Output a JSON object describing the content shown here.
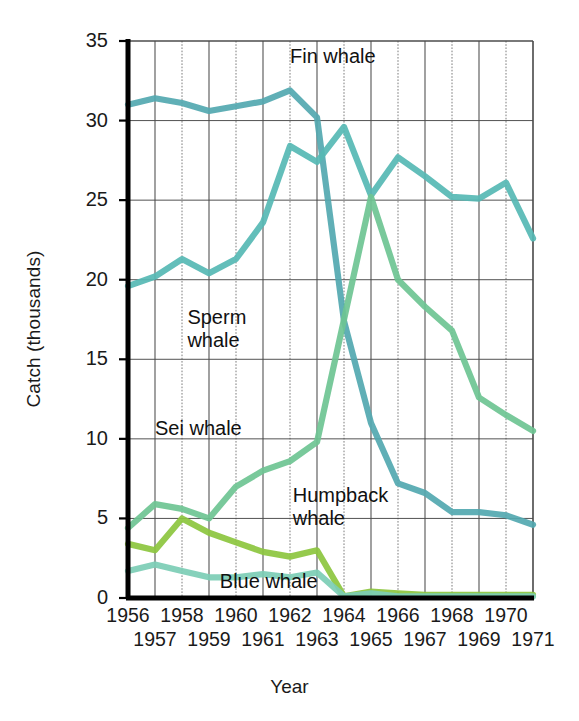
{
  "chart_data": {
    "type": "line",
    "title": "",
    "xlabel": "Year",
    "ylabel": "Catch (thousands)",
    "x": [
      1956,
      1957,
      1958,
      1959,
      1960,
      1961,
      1962,
      1963,
      1964,
      1965,
      1966,
      1967,
      1968,
      1969,
      1970,
      1971
    ],
    "xtick_labels_row1": [
      "1956",
      "1958",
      "1960",
      "1962",
      "1964",
      "1966",
      "1968",
      "1970"
    ],
    "xtick_labels_row2": [
      "1957",
      "1959",
      "1961",
      "1963",
      "1965",
      "1967",
      "1969",
      "1971"
    ],
    "ytick_labels": [
      "35",
      "30",
      "25",
      "20",
      "15",
      "10",
      "5",
      "0"
    ],
    "ytick_values": [
      35,
      30,
      25,
      20,
      15,
      10,
      5,
      0
    ],
    "ylim": [
      0,
      35
    ],
    "xlim": [
      1956,
      1971
    ],
    "grid": true,
    "legend_position": "inline-annotations",
    "series": [
      {
        "name": "Fin whale",
        "color": "#52a8b0",
        "label_text": "Fin whale",
        "values": [
          31.0,
          31.4,
          31.1,
          30.6,
          30.9,
          31.2,
          31.9,
          30.2,
          17.4,
          11.0,
          7.2,
          6.6,
          5.4,
          5.4,
          5.2,
          4.6
        ]
      },
      {
        "name": "Sperm whale",
        "color": "#56b8b4",
        "label_text": "Sperm whale",
        "values": [
          19.6,
          20.2,
          21.3,
          20.4,
          21.3,
          23.6,
          28.4,
          27.4,
          29.6,
          25.3,
          27.7,
          26.5,
          25.2,
          25.1,
          26.1,
          22.6
        ]
      },
      {
        "name": "Sei whale",
        "color": "#6ec493",
        "label_text": "Sei whale",
        "values": [
          4.4,
          5.9,
          5.6,
          5.0,
          7.0,
          8.0,
          8.6,
          9.8,
          17.5,
          25.2,
          20.0,
          18.3,
          16.8,
          12.6,
          11.5,
          10.5
        ]
      },
      {
        "name": "Humpback whale",
        "color": "#8cc63e",
        "label_text": "Humpback whale",
        "values": [
          3.4,
          3.0,
          5.0,
          4.1,
          3.5,
          2.9,
          2.6,
          3.0,
          0.1,
          0.4,
          0.3,
          0.2,
          0.2,
          0.2,
          0.2,
          0.2
        ]
      },
      {
        "name": "Blue whale",
        "color": "#7ccdb5",
        "label_text": "Blue whale",
        "values": [
          1.7,
          2.1,
          1.7,
          1.3,
          1.3,
          1.5,
          1.3,
          1.6,
          0.1,
          0.3,
          0.1,
          0.1,
          0.1,
          0.1,
          0.1,
          0.1
        ]
      }
    ],
    "annotations": [
      {
        "text": "Fin whale",
        "x": 1962,
        "y": 34.0
      },
      {
        "text": "Sperm whale",
        "x": 1958.2,
        "y": 17.6
      },
      {
        "text": "Sei whale",
        "x": 1957.0,
        "y": 10.6
      },
      {
        "text": "Humpback whale",
        "x": 1962.1,
        "y": 6.4
      },
      {
        "text": "Blue whale",
        "x": 1959.4,
        "y": 1.0
      }
    ],
    "axis_color": "#000000",
    "grid_color": "#4a4a4a",
    "background": "#ffffff"
  }
}
